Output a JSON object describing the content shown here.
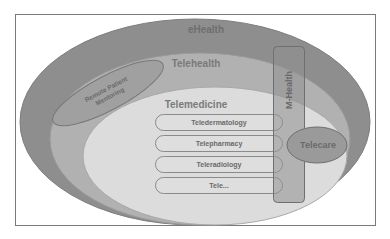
{
  "diagram": {
    "title": "eHealth",
    "levels": [
      {
        "id": "ehealth",
        "label": "eHealth",
        "color": "#8c8c8c"
      },
      {
        "id": "telehealth",
        "label": "Telehealth",
        "color": "#b3b3b3"
      },
      {
        "id": "telemedicine",
        "label": "Telemedicine",
        "color": "#dedede"
      }
    ],
    "remote_patient": {
      "line1": "Remote Patient",
      "line2": "Mentoring"
    },
    "mhealth": {
      "label": "M-Health"
    },
    "telecare": {
      "label": "Telecare"
    },
    "specialties": [
      {
        "label": "Teledermatology"
      },
      {
        "label": "Telepharmacy"
      },
      {
        "label": "Teleradiology"
      },
      {
        "label": "Tele..."
      }
    ]
  }
}
